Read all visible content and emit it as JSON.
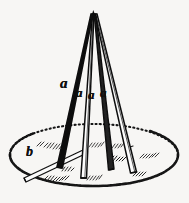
{
  "figure": {
    "background_color": "#f7f6f4",
    "ink_color": "#111111",
    "style": "engraved line drawing",
    "width": 189,
    "height": 203
  },
  "labels": {
    "pole_1": "a",
    "pole_2": "a",
    "pole_3": "a",
    "pole_4": "a",
    "base_radius": "b"
  },
  "geometry": {
    "apex": {
      "x": 93,
      "y": 14
    },
    "base_ellipse": {
      "center_x": 94,
      "center_y": 155,
      "radius_x": 84,
      "radius_y": 31,
      "stroke": "dotted"
    },
    "poles": [
      {
        "name": "pole-left",
        "top_x": 91,
        "bottom_x": 59,
        "bottom_y": 168,
        "width_top": 2.0,
        "width_bottom": 5.0,
        "fill": "#141414"
      },
      {
        "name": "pole-center-left",
        "top_x": 93,
        "bottom_x": 83,
        "bottom_y": 178,
        "width_top": 1.6,
        "width_bottom": 5.0,
        "fill": "#ffffff"
      },
      {
        "name": "pole-center-right",
        "top_x": 95,
        "bottom_x": 110,
        "bottom_y": 170,
        "width_top": 1.6,
        "width_bottom": 5.0,
        "fill": "#2a2a2a"
      },
      {
        "name": "pole-right",
        "top_x": 96,
        "bottom_x": 131,
        "bottom_y": 172,
        "width_top": 1.8,
        "width_bottom": 5.0,
        "fill": "#ffffff"
      }
    ],
    "radius_line": {
      "x1": 25,
      "y1": 177,
      "x2": 84,
      "y2": 152
    }
  },
  "label_positions": {
    "pole_1": {
      "x": 64,
      "y": 83,
      "size": 15
    },
    "pole_2": {
      "x": 79,
      "y": 92,
      "size": 13
    },
    "pole_3": {
      "x": 91,
      "y": 94,
      "size": 13
    },
    "pole_4": {
      "x": 103,
      "y": 92,
      "size": 13
    },
    "base_radius": {
      "x": 29,
      "y": 152,
      "size": 14
    }
  }
}
